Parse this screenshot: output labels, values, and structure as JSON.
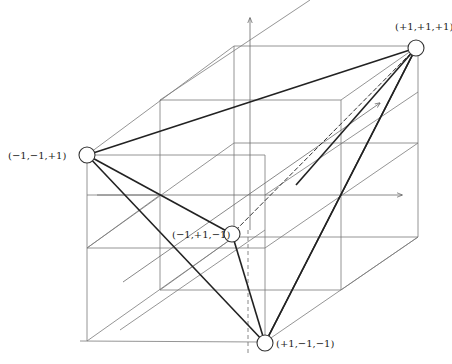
{
  "diagram": {
    "colors": {
      "background": "#ffffff",
      "cube_lines": "#7a7a7a",
      "tetrahedron_edges": "#222222"
    },
    "vertices": [
      {
        "id": "v1",
        "label": "(+1,+1,+1)",
        "x": 416,
        "y": 48
      },
      {
        "id": "v2",
        "label": "(−1,−1,+1)",
        "x": 87,
        "y": 155
      },
      {
        "id": "v3",
        "label": "(−1,+1,−1)",
        "x": 232,
        "y": 234
      },
      {
        "id": "v4",
        "label": "(+1,−1,−1)",
        "x": 265,
        "y": 343
      }
    ],
    "axes": [
      {
        "id": "vertical-axis",
        "direction": "up"
      },
      {
        "id": "horizontal-axis",
        "direction": "right"
      },
      {
        "id": "depth-axis",
        "direction": "back-right"
      }
    ]
  }
}
